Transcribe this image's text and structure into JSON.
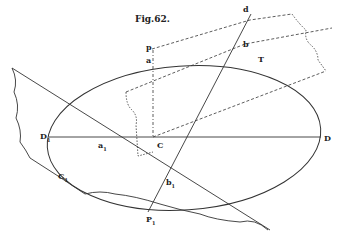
{
  "figure": {
    "title": "Fig.62.",
    "labels": {
      "d": "d",
      "p": "p",
      "a": "a",
      "b": "b",
      "T": "T",
      "D1": "D",
      "D1_sub": "1",
      "a1": "a",
      "a1_sub": "1",
      "C": "C",
      "D": "D",
      "C1": "C",
      "C1_sub": "1",
      "b1": "b",
      "b1_sub": "1",
      "P1": "P",
      "P1_sub": "1"
    },
    "colors": {
      "ink": "#333333",
      "background": "#ffffff"
    }
  }
}
